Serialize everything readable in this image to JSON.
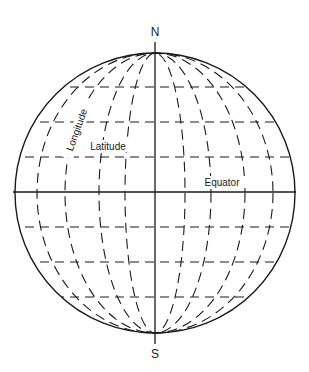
{
  "diagram": {
    "labels": {
      "north": "N",
      "south": "S",
      "longitude": "Longitude",
      "latitude": "Latitude",
      "equator": "Equator"
    },
    "geometry": {
      "center": [
        155,
        193
      ],
      "radius": 140,
      "north_pole": [
        155,
        53
      ],
      "south_pole": [
        155,
        333
      ],
      "equator_y": 192,
      "latitude_lines_y": [
        87,
        122,
        157,
        227,
        262,
        297
      ],
      "meridian_semi_axes": [
        30,
        55,
        90,
        118
      ]
    },
    "colors": {
      "line": "#1a1a1a",
      "background": "#ffffff"
    }
  }
}
